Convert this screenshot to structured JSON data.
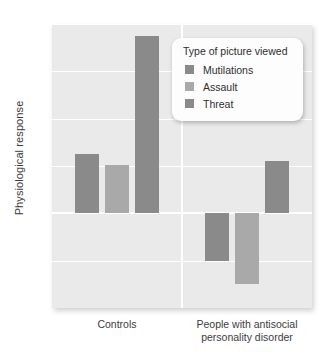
{
  "chart_data": {
    "type": "bar",
    "title": "",
    "xlabel": "",
    "ylabel": "Physiological response",
    "ylim": [
      -4,
      8
    ],
    "yticks": [
      8,
      6,
      4,
      2,
      0,
      -2,
      -4
    ],
    "ytick_labels": [
      "8",
      "6",
      "4",
      "2",
      "0",
      "−2",
      "−4"
    ],
    "grid": true,
    "legend_position": "top-right",
    "legend_title": "Type of picture viewed",
    "categories": [
      "Controls",
      "People with antisocial personality disorder"
    ],
    "category_labels_wrapped": [
      [
        "Controls"
      ],
      [
        "People with antisocial",
        "personality disorder"
      ]
    ],
    "series": [
      {
        "name": "Mutilations",
        "color": "#8a8a8a",
        "values": [
          2.5,
          -2.0
        ]
      },
      {
        "name": "Assault",
        "color": "#a9a9a9",
        "values": [
          2.05,
          -3.0
        ]
      },
      {
        "name": "Threat",
        "color": "#8a8a8a",
        "values": [
          7.5,
          2.2
        ]
      }
    ]
  },
  "style": {
    "plot_background": "#eaeaea",
    "gridline_color": "#ffffff",
    "text_color": "#3b3b3b",
    "legend_background": "#fdfdfd"
  }
}
